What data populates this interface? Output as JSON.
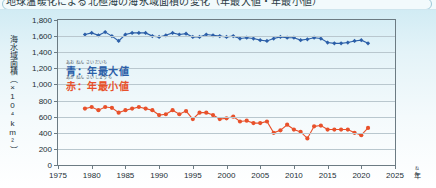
{
  "figure": {
    "caption_clipped": "地球温暖化による北極海の海氷域面積の変化（年最大値・年最小値）",
    "y_axis_title": "海水域面積（×10⁴km²）",
    "y_axis_title_ruby": "かいすいいきめんせき",
    "x_axis_unit": "年",
    "x_axis_unit_ruby": "ねん"
  },
  "legend": {
    "position": "inside-upper-left",
    "entries": [
      {
        "ruby": "あお  ねん さいだいち",
        "label": "青：年最大値",
        "color": "#2c5fa8",
        "series": "max"
      },
      {
        "ruby": "あか  ねん さいしょうち",
        "label": "赤：年最小値",
        "color": "#e8512b",
        "series": "min"
      }
    ]
  },
  "chart_data": {
    "type": "line",
    "title": "地球温暖化による北極海の海氷域面積の変化（年最大値・年最小値）",
    "xlabel": "年",
    "ylabel": "海水域面積（×10⁴km²）",
    "xlim": [
      1975,
      2025
    ],
    "ylim": [
      0,
      1800
    ],
    "ytick_labels": [
      "0",
      "200",
      "400",
      "600",
      "800",
      "1,000",
      "1,200",
      "1,400",
      "1,600",
      "1,800"
    ],
    "ytick_values": [
      0,
      200,
      400,
      600,
      800,
      1000,
      1200,
      1400,
      1600,
      1800
    ],
    "xtick_values": [
      1975,
      1980,
      1985,
      1990,
      1995,
      2000,
      2005,
      2010,
      2015,
      2020,
      2025
    ],
    "grid": true,
    "legend_position": "upper-left-inside",
    "x": [
      1979,
      1980,
      1981,
      1982,
      1983,
      1984,
      1985,
      1986,
      1987,
      1988,
      1989,
      1990,
      1991,
      1992,
      1993,
      1994,
      1995,
      1996,
      1997,
      1998,
      1999,
      2000,
      2001,
      2002,
      2003,
      2004,
      2005,
      2006,
      2007,
      2008,
      2009,
      2010,
      2011,
      2012,
      2013,
      2014,
      2015,
      2016,
      2017,
      2018,
      2019,
      2020,
      2021
    ],
    "series": [
      {
        "name": "年最大値",
        "color": "#2c5fa8",
        "marker": "diamond",
        "values": [
          1620,
          1640,
          1610,
          1650,
          1600,
          1540,
          1620,
          1640,
          1640,
          1640,
          1600,
          1590,
          1610,
          1640,
          1620,
          1630,
          1590,
          1590,
          1620,
          1610,
          1600,
          1590,
          1600,
          1570,
          1580,
          1570,
          1550,
          1540,
          1570,
          1590,
          1580,
          1580,
          1550,
          1560,
          1580,
          1570,
          1520,
          1510,
          1510,
          1520,
          1540,
          1550,
          1510
        ]
      },
      {
        "name": "年最小値",
        "color": "#e8512b",
        "marker": "circle",
        "values": [
          700,
          720,
          680,
          720,
          710,
          650,
          680,
          700,
          720,
          700,
          680,
          620,
          630,
          680,
          630,
          670,
          570,
          650,
          650,
          620,
          570,
          580,
          600,
          540,
          550,
          520,
          520,
          540,
          400,
          430,
          500,
          440,
          410,
          330,
          480,
          490,
          440,
          440,
          440,
          440,
          400,
          370,
          460
        ]
      }
    ]
  }
}
